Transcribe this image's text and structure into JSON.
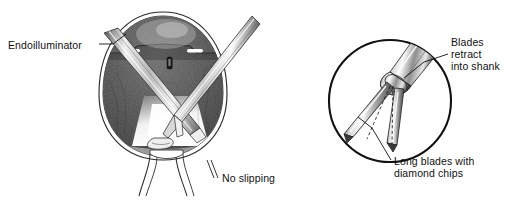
{
  "figure": {
    "background_color": "#ffffff",
    "ink_color": "#111111",
    "panels": [
      {
        "name": "eye-cross-section",
        "description": "Sagittal cross-section of a globe with vitreous cavity, instruments entering through pars plana sclerotomies, illuminated retina and optic nerve stalk"
      },
      {
        "name": "forceps-detail-circle",
        "description": "Circular magnified inset of forceps tip showing two long blades and shank collar"
      }
    ]
  },
  "labels": {
    "endoilluminator": "Endoilluminator",
    "no_slipping": "No slipping",
    "blades_retract": "Blades\nretract\ninto shank",
    "long_blades": "Long blades with\ndiamond chips"
  },
  "colors": {
    "ink": "#111111",
    "outline": "#2b2b2b",
    "vitreous_dark": "#4a4a4a",
    "vitreous_darker": "#2e2e2e",
    "light_cone": "#fdfdfd",
    "metal_light": "#f2f2f2",
    "metal_mid": "#9a9a9a",
    "metal_dark": "#4b4b4b",
    "sclera": "#ffffff"
  }
}
